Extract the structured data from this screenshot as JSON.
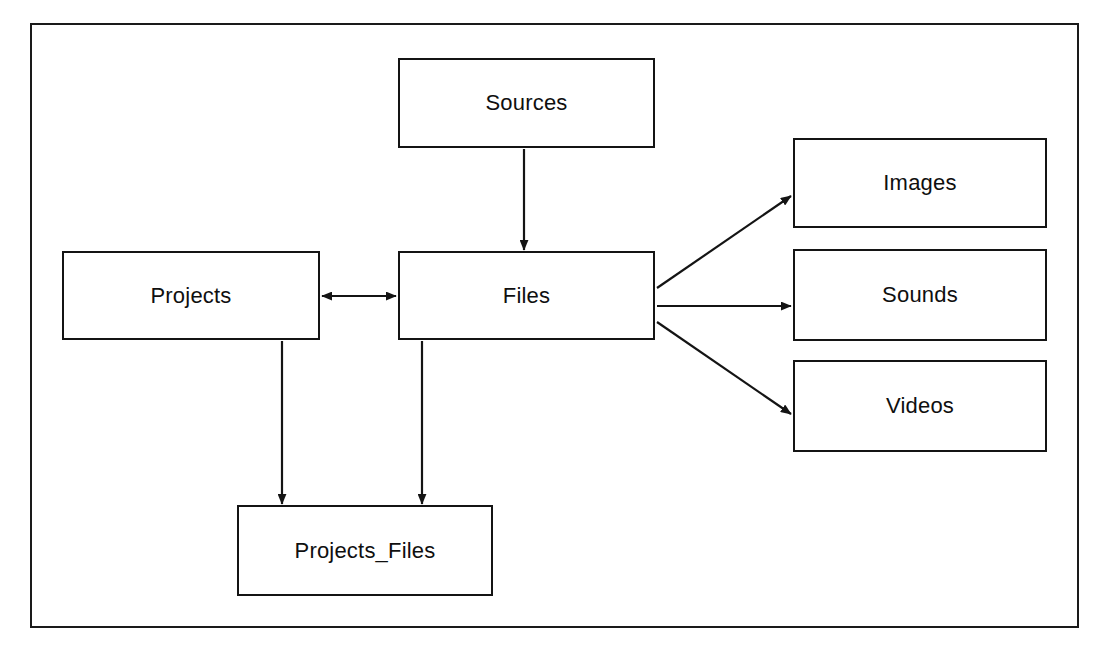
{
  "diagram": {
    "background_color": "#ffffff",
    "frame_color": "#1a1a1a",
    "node_border_color": "#141414",
    "edge_color": "#141414",
    "nodes": [
      {
        "id": "sources",
        "label": "Sources"
      },
      {
        "id": "projects",
        "label": "Projects"
      },
      {
        "id": "files",
        "label": "Files"
      },
      {
        "id": "images",
        "label": "Images"
      },
      {
        "id": "sounds",
        "label": "Sounds"
      },
      {
        "id": "videos",
        "label": "Videos"
      },
      {
        "id": "projects_files",
        "label": "Projects_Files"
      }
    ],
    "edges": [
      {
        "from": "sources",
        "to": "files",
        "direction": "one-way"
      },
      {
        "from": "projects",
        "to": "files",
        "direction": "two-way"
      },
      {
        "from": "files",
        "to": "images",
        "direction": "one-way"
      },
      {
        "from": "files",
        "to": "sounds",
        "direction": "one-way"
      },
      {
        "from": "files",
        "to": "videos",
        "direction": "one-way"
      },
      {
        "from": "projects",
        "to": "projects_files",
        "direction": "one-way"
      },
      {
        "from": "files",
        "to": "projects_files",
        "direction": "one-way"
      }
    ]
  }
}
